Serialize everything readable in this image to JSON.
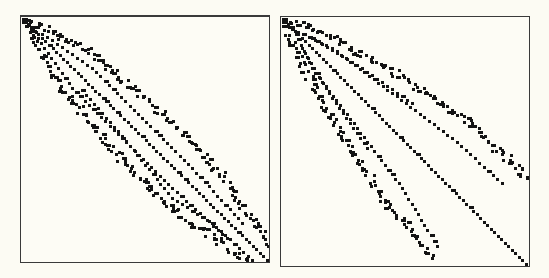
{
  "figure": {
    "background": "#fcfbf3",
    "dot_color": "#141414",
    "panels": [
      {
        "id": "left",
        "pattern": "symmetric banded with main diagonal and two wavy off-diagonal bands on each side",
        "size": [
          248,
          245
        ],
        "dot": 3,
        "bands": [
          {
            "name": "main-diagonal",
            "pts": [
              [
                2,
                2
              ],
              [
                245,
                242
              ]
            ],
            "step": 5,
            "width": 1
          },
          {
            "name": "upper-band-1",
            "pts": [
              [
                8,
                4
              ],
              [
                60,
                30
              ],
              [
                110,
                70
              ],
              [
                160,
                115
              ],
              [
                200,
                160
              ],
              [
                246,
                228
              ]
            ],
            "step": 5,
            "width": 2
          },
          {
            "name": "upper-band-2",
            "pts": [
              [
                4,
                8
              ],
              [
                30,
                22
              ],
              [
                70,
                50
              ],
              [
                120,
                100
              ],
              [
                170,
                150
              ],
              [
                220,
                205
              ]
            ],
            "step": 6,
            "width": 1
          },
          {
            "name": "lower-band-1",
            "pts": [
              [
                4,
                8
              ],
              [
                30,
                60
              ],
              [
                70,
                110
              ],
              [
                115,
                160
              ],
              [
                160,
                200
              ],
              [
                228,
                246
              ]
            ],
            "step": 5,
            "width": 2
          },
          {
            "name": "lower-band-2",
            "pts": [
              [
                8,
                4
              ],
              [
                22,
                30
              ],
              [
                50,
                70
              ],
              [
                100,
                120
              ],
              [
                150,
                170
              ],
              [
                205,
                220
              ]
            ],
            "step": 6,
            "width": 1
          },
          {
            "name": "lower-band-3",
            "pts": [
              [
                60,
                72
              ],
              [
                100,
                118
              ],
              [
                150,
                180
              ],
              [
                190,
                205
              ],
              [
                230,
                242
              ]
            ],
            "step": 6,
            "width": 1
          }
        ]
      },
      {
        "id": "right",
        "pattern": "main diagonal with two upper bands ending at right edge and two lower bands ending at bottom",
        "size": [
          248,
          248
        ],
        "dot": 3,
        "bands": [
          {
            "name": "main-diagonal",
            "pts": [
              [
                2,
                2
              ],
              [
                244,
                246
              ]
            ],
            "step": 5,
            "width": 1
          },
          {
            "name": "upper-band-1",
            "pts": [
              [
                10,
                2
              ],
              [
                60,
                25
              ],
              [
                120,
                60
              ],
              [
                180,
                100
              ],
              [
                245,
                160
              ]
            ],
            "step": 5,
            "width": 2
          },
          {
            "name": "upper-band-2",
            "pts": [
              [
                4,
                8
              ],
              [
                50,
                30
              ],
              [
                110,
                75
              ],
              [
                170,
                120
              ],
              [
                220,
                165
              ]
            ],
            "step": 6,
            "width": 1
          },
          {
            "name": "upper-band-3",
            "pts": [
              [
                30,
                20
              ],
              [
                80,
                50
              ],
              [
                130,
                85
              ]
            ],
            "step": 6,
            "width": 1
          },
          {
            "name": "lower-band-1",
            "pts": [
              [
                2,
                10
              ],
              [
                25,
                60
              ],
              [
                60,
                120
              ],
              [
                100,
                180
              ],
              [
                150,
                240
              ]
            ],
            "step": 5,
            "width": 2
          },
          {
            "name": "lower-band-2",
            "pts": [
              [
                8,
                4
              ],
              [
                30,
                50
              ],
              [
                75,
                110
              ],
              [
                120,
                170
              ],
              [
                155,
                228
              ]
            ],
            "step": 6,
            "width": 1
          },
          {
            "name": "lower-band-3",
            "pts": [
              [
                20,
                30
              ],
              [
                50,
                80
              ],
              [
                85,
                130
              ]
            ],
            "step": 6,
            "width": 1
          }
        ]
      }
    ]
  }
}
